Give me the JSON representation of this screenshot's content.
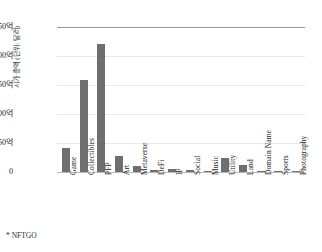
{
  "footnote": "* NFTGO",
  "chart_data": {
    "type": "bar",
    "title": "",
    "xlabel": "",
    "ylabel": "시가 총액 (단위: 달러)",
    "ylim": [
      0,
      250
    ],
    "yunit": "억",
    "ytick_labels": [
      "250억",
      "200억",
      "150억",
      "100억",
      "50억",
      "0"
    ],
    "ytick_values": [
      250,
      200,
      150,
      100,
      50,
      0
    ],
    "grid": true,
    "legend": false,
    "bar_color": "#706f6f",
    "categories": [
      "Game",
      "Collectibles",
      "PFP",
      "Art",
      "Metaverse",
      "DeFi",
      "IP",
      "Social",
      "Music",
      "Utility",
      "Land",
      "Domain Name",
      "Sports",
      "Photography"
    ],
    "values": [
      41,
      158,
      221,
      27,
      10,
      4,
      5,
      3,
      2,
      24,
      12,
      1,
      1,
      0.5
    ]
  }
}
